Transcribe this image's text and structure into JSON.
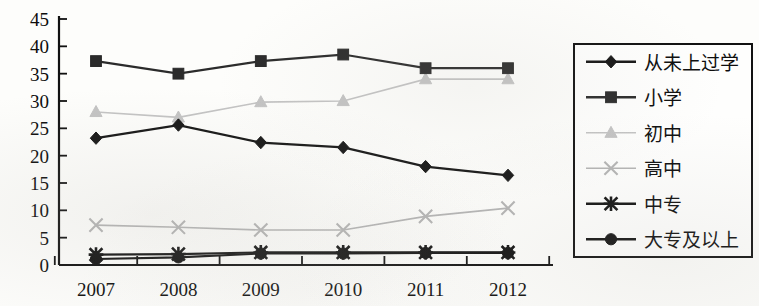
{
  "chart_data": {
    "type": "line",
    "title": "",
    "subtitle": "",
    "xlabel": "",
    "ylabel": "",
    "categories": [
      "2007",
      "2008",
      "2009",
      "2010",
      "2011",
      "2012"
    ],
    "ylim": [
      0,
      45
    ],
    "yticks": [
      0,
      5,
      10,
      15,
      20,
      25,
      30,
      35,
      40,
      45
    ],
    "grid": false,
    "legend_position": "right",
    "series": [
      {
        "name": "从未上过学",
        "marker": "diamond",
        "color": "#151515",
        "values": [
          23.2,
          25.6,
          22.4,
          21.5,
          18.0,
          16.4
        ]
      },
      {
        "name": "小学",
        "marker": "square",
        "color": "#2b2b2b",
        "values": [
          37.3,
          35.0,
          37.3,
          38.5,
          36.0,
          36.0
        ]
      },
      {
        "name": "初中",
        "marker": "triangle",
        "color": "#c3c3c3",
        "values": [
          28.0,
          27.0,
          29.8,
          30.0,
          34.0,
          34.0
        ]
      },
      {
        "name": "高中",
        "marker": "cross",
        "color": "#b4b4b4",
        "values": [
          7.3,
          6.9,
          6.4,
          6.4,
          8.9,
          10.4
        ]
      },
      {
        "name": "中专",
        "marker": "asterisk",
        "color": "#121212",
        "values": [
          1.9,
          2.0,
          2.3,
          2.3,
          2.3,
          2.3
        ]
      },
      {
        "name": "大专及以上",
        "marker": "circle",
        "color": "#121212",
        "values": [
          1.1,
          1.4,
          2.1,
          2.1,
          2.2,
          2.2
        ]
      }
    ]
  },
  "axes": {
    "y_tick_labels": [
      "45",
      "40",
      "35",
      "30",
      "25",
      "20",
      "15",
      "10",
      "5",
      "0"
    ],
    "x_tick_labels": [
      "2007",
      "2008",
      "2009",
      "2010",
      "2011",
      "2012"
    ]
  },
  "legend": {
    "items": [
      {
        "label": "从未上过学",
        "marker": "diamond",
        "color": "#151515"
      },
      {
        "label": "小学",
        "marker": "square",
        "color": "#2b2b2b"
      },
      {
        "label": "初中",
        "marker": "triangle",
        "color": "#c3c3c3"
      },
      {
        "label": "高中",
        "marker": "cross",
        "color": "#b4b4b4"
      },
      {
        "label": "中专",
        "marker": "asterisk",
        "color": "#121212"
      },
      {
        "label": "大专及以上",
        "marker": "circle",
        "color": "#121212"
      }
    ]
  }
}
